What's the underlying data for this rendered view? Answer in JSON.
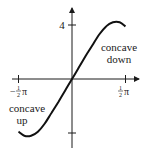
{
  "chart_data": {
    "type": "line",
    "title": "",
    "xlabel": "",
    "ylabel": "",
    "xlim": [
      -1.5708,
      1.5708
    ],
    "ylim": [
      -4.6,
      5.2
    ],
    "grid": false,
    "x_ticks": [
      {
        "value": -1.5708,
        "label": "-1/2 π"
      },
      {
        "value": 1.5708,
        "label": "1/2 π"
      }
    ],
    "y_ticks": [
      {
        "value": 4,
        "label": "4"
      },
      {
        "value": -4,
        "label": ""
      }
    ],
    "series": [
      {
        "name": "f",
        "x": [
          -1.5708,
          -1.4,
          -1.2,
          -1.0,
          -0.8,
          -0.6,
          -0.4,
          -0.2,
          0,
          0.2,
          0.4,
          0.6,
          0.8,
          1.0,
          1.2,
          1.4,
          1.5708
        ],
        "y": [
          -3.9,
          -4.2,
          -4.2,
          -3.9,
          -3.3,
          -2.5,
          -1.7,
          -0.85,
          0,
          0.85,
          1.7,
          2.5,
          3.3,
          3.9,
          4.2,
          4.2,
          3.9
        ]
      }
    ],
    "annotations": [
      {
        "text": [
          "concave",
          "down"
        ],
        "position": "right, above x-axis"
      },
      {
        "text": [
          "concave",
          "up"
        ],
        "position": "left, below x-axis"
      }
    ]
  }
}
